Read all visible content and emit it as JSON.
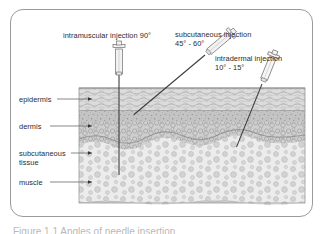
{
  "figure": {
    "title_caption": "Figure 1.1  Angles of needle insertion",
    "colors": {
      "border": "#9a9a9a",
      "text": "#2b2b2b",
      "epidermis": "#d7d7d7",
      "dermis": "#bfbfbf",
      "subcutaneous": "#e6e6e6",
      "muscle": "#d2d2d2",
      "needle": "#3a3a3a",
      "leader_line": "#6b6b6b"
    }
  },
  "injection_labels": [
    {
      "id": "intramuscular",
      "name": "intramuscular injection 90°",
      "line1": "intramuscular injection 90°",
      "line2": "",
      "angle": "90°"
    },
    {
      "id": "subcutaneous",
      "name": "subcutaneous injection 45° - 60°",
      "line1": "subcutaneous injection",
      "line2": "45° - 60°",
      "angle": "45° - 60°"
    },
    {
      "id": "intradermal",
      "name": "intradermal injection 10° - 15°",
      "line1": "intradermal injection",
      "line2": "10° - 15°",
      "angle": "10° - 15°"
    }
  ],
  "layer_labels": [
    {
      "id": "epidermis",
      "line1": "epidermis",
      "line2": ""
    },
    {
      "id": "dermis",
      "line1": "dermis",
      "line2": ""
    },
    {
      "id": "subcutaneous",
      "line1": "subcutaneous",
      "line2": "tissue"
    },
    {
      "id": "muscle",
      "line1": "muscle",
      "line2": ""
    }
  ]
}
